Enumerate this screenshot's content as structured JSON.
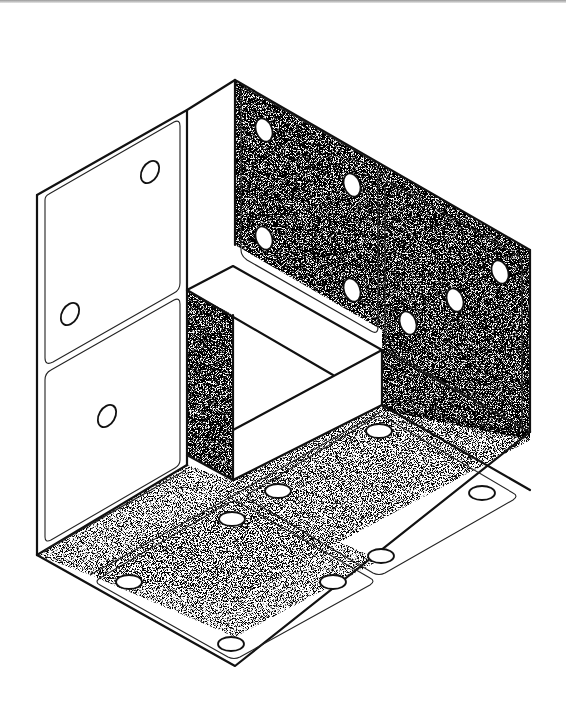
{
  "figure": {
    "colors": {
      "line": "#111111",
      "background": "#ffffff",
      "stipple": "#555555"
    },
    "faces": [
      {
        "name": "left-wall-upper-panel",
        "pips": 2,
        "shading": "plain"
      },
      {
        "name": "left-wall-lower-panel",
        "pips": 1,
        "shading": "plain"
      },
      {
        "name": "back-wall-left-panel",
        "pips": 4,
        "shading": "stippled"
      },
      {
        "name": "back-wall-right-panel",
        "pips": 3,
        "shading": "stippled"
      },
      {
        "name": "floor-left-panel",
        "pips": 4,
        "shading": "light-stippled"
      },
      {
        "name": "floor-right-panel",
        "pips": 4,
        "shading": "light-stippled"
      }
    ],
    "central_block": {
      "shape": "triangular-cutout-frame",
      "shading": "stippled-sides"
    }
  }
}
